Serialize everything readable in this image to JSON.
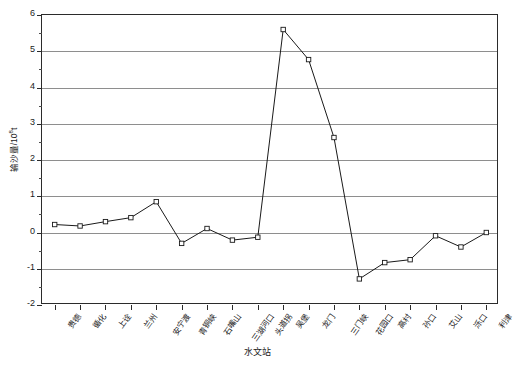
{
  "chart_data": {
    "type": "line",
    "title": "",
    "xlabel": "水文站",
    "ylabel": "输沙量/10⁸t",
    "ylabel_base": "输沙量/10",
    "ylabel_exp": "8",
    "ylabel_unit": "t",
    "ylim": [
      -2,
      6
    ],
    "grid": true,
    "legend": "none",
    "marker": "open-square",
    "line_color": "#1a1a1a",
    "grid_color": "#8e8e8e",
    "axis_color": "#2b2b2b",
    "categories": [
      "贵德",
      "循化",
      "上诠",
      "兰州",
      "安宁渡",
      "青铜峡",
      "石嘴山",
      "三湖河口",
      "头道拐",
      "吴堡",
      "龙门",
      "三门峡",
      "花园口",
      "高村",
      "孙口",
      "艾山",
      "泺口",
      "利津"
    ],
    "values": [
      0.22,
      0.18,
      0.3,
      0.41,
      0.85,
      -0.3,
      0.11,
      -0.21,
      -0.13,
      5.6,
      4.77,
      2.62,
      -1.28,
      -0.83,
      -0.75,
      -0.09,
      -0.4,
      0.0
    ],
    "ytick_labels": [
      "6",
      "5",
      "4",
      "3",
      "2",
      "1",
      "0",
      "-1",
      "-2"
    ],
    "ytick_values": [
      6,
      5,
      4,
      3,
      2,
      1,
      0,
      -1,
      -2
    ],
    "yminor_values": [
      5.5,
      4.5,
      3.5,
      2.5,
      1.5,
      0.5,
      -0.5,
      -1.5
    ]
  }
}
